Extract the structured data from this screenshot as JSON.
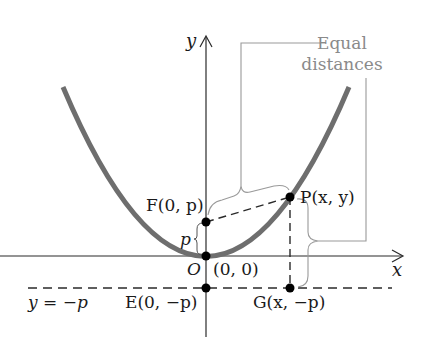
{
  "diagram": {
    "labels": {
      "y_axis": "y",
      "x_axis": "x",
      "callout_line1": "Equal",
      "callout_line2": "distances",
      "focus": "F(0, p)",
      "point": "P(x, y)",
      "p_dist": "p",
      "origin": "O",
      "origin_coords": "(0, 0)",
      "directrix": "y = −p",
      "e_point": "E(0, −p)",
      "g_point": "G(x, −p)"
    },
    "colors": {
      "curve": "#6e6e6e",
      "axes": "#2a2a2a",
      "callout": "#9a9a9a",
      "points": "#000000"
    },
    "points": {
      "F": [
        206,
        222
      ],
      "O": [
        206,
        256
      ],
      "P": [
        290,
        197
      ],
      "E": [
        206,
        288
      ],
      "G": [
        290,
        288
      ]
    }
  }
}
